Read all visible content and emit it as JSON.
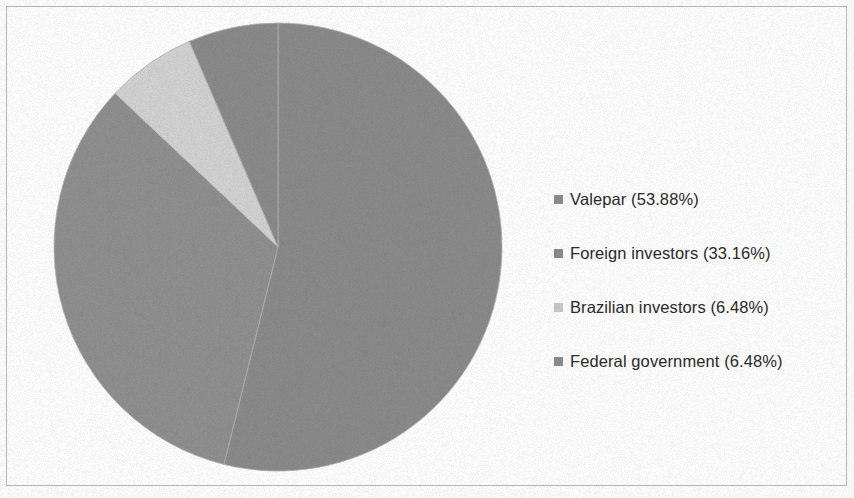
{
  "chart_data": {
    "type": "pie",
    "title": "",
    "subtitle": "",
    "xlabel": "",
    "ylabel": "",
    "legend_position": "right",
    "grid": false,
    "start_angle_deg": 0,
    "direction": "clockwise",
    "categories": [
      "Valepar",
      "Foreign investors",
      "Brazilian investors",
      "Federal government"
    ],
    "values": [
      53.88,
      33.16,
      6.48,
      6.48
    ],
    "value_unit": "%",
    "colors": [
      "#8a8a8a",
      "#8f8f8f",
      "#d2d2d2",
      "#8a8a8a"
    ],
    "slices": [
      {
        "label": "Valepar",
        "value": 53.88,
        "value_text": "53.88%",
        "legend_text": "Valepar (53.88%)",
        "color": "#8a8a8a"
      },
      {
        "label": "Foreign investors",
        "value": 33.16,
        "value_text": "33.16%",
        "legend_text": "Foreign investors (33.16%)",
        "color": "#8f8f8f"
      },
      {
        "label": "Brazilian investors",
        "value": 6.48,
        "value_text": "6.48%",
        "legend_text": "Brazilian investors (6.48%)",
        "color": "#d2d2d2"
      },
      {
        "label": "Federal government",
        "value": 6.48,
        "value_text": "6.48%",
        "legend_text": "Federal government (6.48%)",
        "color": "#8a8a8a"
      }
    ]
  },
  "legend": {
    "items": [
      {
        "label": "Valepar (53.88%)",
        "swatch_color": "#8d8d8d"
      },
      {
        "label": "Foreign investors (33.16%)",
        "swatch_color": "#8a8a8a"
      },
      {
        "label": "Brazilian investors (6.48%)",
        "swatch_color": "#c9c9c9"
      },
      {
        "label": "Federal government (6.48%)",
        "swatch_color": "#8d8d8d"
      }
    ]
  },
  "figure": {
    "background_color": "#fdfdfd",
    "border_color": "#b9b9b9"
  }
}
